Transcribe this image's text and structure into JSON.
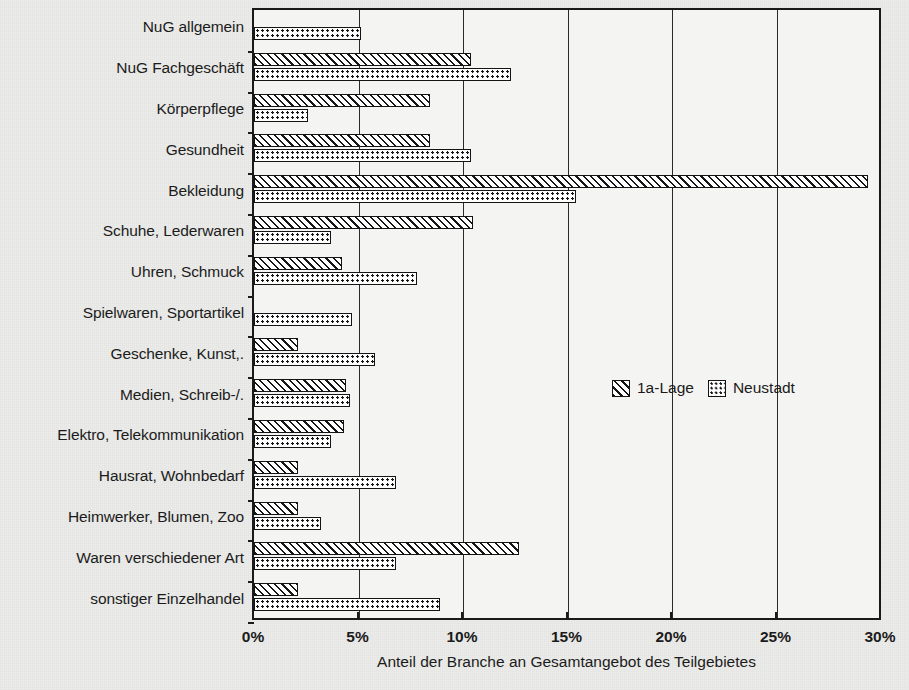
{
  "chart_data": {
    "type": "bar",
    "orientation": "horizontal",
    "title": "",
    "xlabel": "Anteil der Branche an Gesamtangebot des Teilgebietes",
    "ylabel": "",
    "xlim": [
      0,
      30
    ],
    "xticks": [
      0,
      5,
      10,
      15,
      20,
      25,
      30
    ],
    "xtick_labels": [
      "0%",
      "5%",
      "10%",
      "15%",
      "20%",
      "25%",
      "30%"
    ],
    "grid": "vertical",
    "legend_position": "inside-right",
    "categories": [
      "NuG allgemein",
      "NuG Fachgeschäft",
      "Körperpflege",
      "Gesundheit",
      "Bekleidung",
      "Schuhe, Lederwaren",
      "Uhren, Schmuck",
      "Spielwaren, Sportartikel",
      "Geschenke, Kunst,.",
      "Medien, Schreib-/.",
      "Elektro, Telekommunikation",
      "Hausrat, Wohnbedarf",
      "Heimwerker, Blumen, Zoo",
      "Waren verschiedener Art",
      "sonstiger Einzelhandel"
    ],
    "series": [
      {
        "name": "1a-Lage",
        "pattern": "diagonal-hatch",
        "values": [
          0,
          10.4,
          8.4,
          8.4,
          29.4,
          10.5,
          4.2,
          0,
          2.1,
          4.4,
          4.3,
          2.1,
          2.1,
          12.7,
          2.1
        ]
      },
      {
        "name": "Neustadt",
        "pattern": "dotted",
        "values": [
          5.1,
          12.3,
          2.6,
          10.4,
          15.4,
          3.7,
          7.8,
          4.7,
          5.8,
          4.6,
          3.7,
          6.8,
          3.2,
          6.8,
          8.9
        ]
      }
    ],
    "legend": [
      "1a-Lage",
      "Neustadt"
    ],
    "colors": {
      "bar_outline": "#141414",
      "bar_fill": "#ffffff",
      "grid": "#2a2a2a",
      "frame": "#1a1a1a",
      "text": "#1b1b1b",
      "background": "#ececea"
    }
  }
}
